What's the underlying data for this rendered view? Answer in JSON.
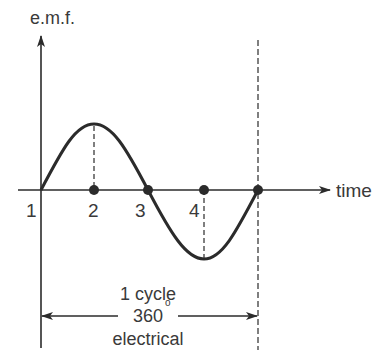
{
  "axes": {
    "y_label": "e.m.f.",
    "x_label": "time"
  },
  "points": [
    {
      "label": "1",
      "description": "start, zero crossing"
    },
    {
      "label": "2",
      "description": "positive peak position"
    },
    {
      "label": "3",
      "description": "zero crossing, half cycle"
    },
    {
      "label": "4",
      "description": "negative peak position"
    }
  ],
  "cycle_annotation": {
    "line1": "1 cycle",
    "line2": "360",
    "degree_symbol": "o",
    "line3": "electrical"
  },
  "colors": {
    "stroke": "#2b2b2b",
    "text": "#3a3a3a",
    "background": "#ffffff"
  }
}
